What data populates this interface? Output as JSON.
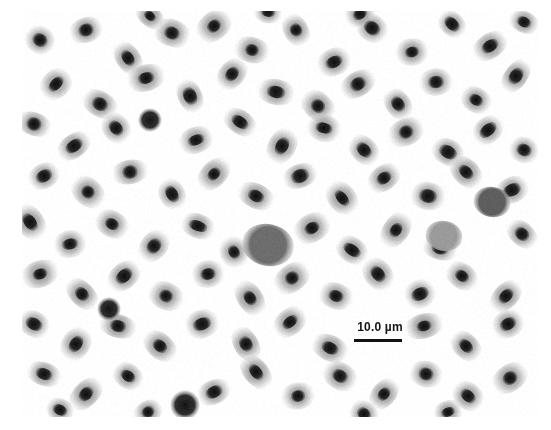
{
  "figure": {
    "kind": "light-microscopy-photomicrograph",
    "specimen": "blood smear",
    "background_color": "#ffffff",
    "frame": {
      "x": 22,
      "y": 11,
      "width": 516,
      "height": 406
    }
  },
  "scalebar": {
    "label": "10.0 µm",
    "bar_color": "#121212",
    "text_color": "#151515",
    "bar_length_px": 48,
    "position": {
      "x": 345,
      "y": 320
    }
  },
  "palette": {
    "background": "#ffffff",
    "cytoplasm_light": "#e7e7e7",
    "cytoplasm_mid": "#b9b9b9",
    "nucleus_dark": "#1d1d1d",
    "leukocyte_gray": "#6a6a6a",
    "platelet_dark": "#161616"
  },
  "chart_data": {
    "type": "scatter",
    "title": "",
    "xlabel": "",
    "ylabel": "",
    "xlim": [
      22,
      538
    ],
    "ylim": [
      11,
      417
    ],
    "grid": false,
    "legend": null,
    "series": [
      {
        "name": "erythrocyte",
        "marker": "ellipse-with-nucleus",
        "cell_rx": 19,
        "cell_ry": 13,
        "nucleus_rx": 9,
        "nucleus_ry": 6,
        "points": [
          {
            "x": 40,
            "y": 40,
            "rot": 35,
            "s": 1.0
          },
          {
            "x": 86,
            "y": 30,
            "rot": -20,
            "s": 1.0
          },
          {
            "x": 128,
            "y": 58,
            "rot": 55,
            "s": 0.95
          },
          {
            "x": 172,
            "y": 33,
            "rot": 20,
            "s": 1.0
          },
          {
            "x": 214,
            "y": 26,
            "rot": -40,
            "s": 1.0
          },
          {
            "x": 252,
            "y": 50,
            "rot": 15,
            "s": 1.0
          },
          {
            "x": 296,
            "y": 30,
            "rot": 60,
            "s": 0.95
          },
          {
            "x": 334,
            "y": 62,
            "rot": -25,
            "s": 1.0
          },
          {
            "x": 372,
            "y": 28,
            "rot": 35,
            "s": 1.0
          },
          {
            "x": 412,
            "y": 52,
            "rot": -10,
            "s": 1.0
          },
          {
            "x": 452,
            "y": 24,
            "rot": 45,
            "s": 0.95
          },
          {
            "x": 490,
            "y": 46,
            "rot": -35,
            "s": 1.0
          },
          {
            "x": 524,
            "y": 22,
            "rot": 25,
            "s": 0.9
          },
          {
            "x": 56,
            "y": 84,
            "rot": -45,
            "s": 1.0
          },
          {
            "x": 100,
            "y": 104,
            "rot": 30,
            "s": 1.0
          },
          {
            "x": 146,
            "y": 78,
            "rot": -15,
            "s": 1.0
          },
          {
            "x": 190,
            "y": 96,
            "rot": 65,
            "s": 1.0
          },
          {
            "x": 232,
            "y": 74,
            "rot": -50,
            "s": 1.0
          },
          {
            "x": 276,
            "y": 92,
            "rot": 10,
            "s": 1.0
          },
          {
            "x": 318,
            "y": 106,
            "rot": 40,
            "s": 1.0
          },
          {
            "x": 358,
            "y": 84,
            "rot": -30,
            "s": 1.0
          },
          {
            "x": 398,
            "y": 104,
            "rot": 55,
            "s": 1.0
          },
          {
            "x": 436,
            "y": 82,
            "rot": -5,
            "s": 1.0
          },
          {
            "x": 476,
            "y": 100,
            "rot": 30,
            "s": 1.0
          },
          {
            "x": 516,
            "y": 76,
            "rot": -55,
            "s": 0.95
          },
          {
            "x": 34,
            "y": 124,
            "rot": 20,
            "s": 1.0
          },
          {
            "x": 74,
            "y": 146,
            "rot": -35,
            "s": 1.0
          },
          {
            "x": 116,
            "y": 128,
            "rot": 50,
            "s": 1.0
          },
          {
            "x": 196,
            "y": 140,
            "rot": -20,
            "s": 1.0
          },
          {
            "x": 240,
            "y": 122,
            "rot": 35,
            "s": 1.0
          },
          {
            "x": 282,
            "y": 146,
            "rot": -60,
            "s": 1.0
          },
          {
            "x": 324,
            "y": 128,
            "rot": 15,
            "s": 1.0
          },
          {
            "x": 364,
            "y": 150,
            "rot": 45,
            "s": 1.0
          },
          {
            "x": 406,
            "y": 132,
            "rot": -25,
            "s": 1.0
          },
          {
            "x": 448,
            "y": 152,
            "rot": 30,
            "s": 1.0
          },
          {
            "x": 488,
            "y": 130,
            "rot": -40,
            "s": 1.0
          },
          {
            "x": 524,
            "y": 150,
            "rot": 20,
            "s": 0.95
          },
          {
            "x": 44,
            "y": 176,
            "rot": -30,
            "s": 1.0
          },
          {
            "x": 88,
            "y": 192,
            "rot": 40,
            "s": 1.0
          },
          {
            "x": 130,
            "y": 172,
            "rot": -10,
            "s": 1.0
          },
          {
            "x": 172,
            "y": 194,
            "rot": 60,
            "s": 1.0
          },
          {
            "x": 214,
            "y": 174,
            "rot": -45,
            "s": 1.0
          },
          {
            "x": 256,
            "y": 196,
            "rot": 25,
            "s": 1.0
          },
          {
            "x": 300,
            "y": 176,
            "rot": -20,
            "s": 1.0
          },
          {
            "x": 342,
            "y": 198,
            "rot": 50,
            "s": 1.0
          },
          {
            "x": 384,
            "y": 178,
            "rot": -35,
            "s": 1.0
          },
          {
            "x": 428,
            "y": 196,
            "rot": 10,
            "s": 1.0
          },
          {
            "x": 466,
            "y": 172,
            "rot": 45,
            "s": 1.0
          },
          {
            "x": 512,
            "y": 190,
            "rot": -25,
            "s": 1.0
          },
          {
            "x": 30,
            "y": 222,
            "rot": 55,
            "s": 1.0
          },
          {
            "x": 70,
            "y": 244,
            "rot": -15,
            "s": 1.0
          },
          {
            "x": 112,
            "y": 224,
            "rot": 30,
            "s": 1.0
          },
          {
            "x": 154,
            "y": 246,
            "rot": -50,
            "s": 1.0
          },
          {
            "x": 198,
            "y": 226,
            "rot": 20,
            "s": 1.0
          },
          {
            "x": 234,
            "y": 252,
            "rot": 65,
            "s": 1.0
          },
          {
            "x": 312,
            "y": 228,
            "rot": -30,
            "s": 1.0
          },
          {
            "x": 352,
            "y": 250,
            "rot": 35,
            "s": 1.0
          },
          {
            "x": 396,
            "y": 230,
            "rot": -55,
            "s": 1.0
          },
          {
            "x": 440,
            "y": 248,
            "rot": 15,
            "s": 1.0
          },
          {
            "x": 522,
            "y": 234,
            "rot": 40,
            "s": 0.95
          },
          {
            "x": 40,
            "y": 274,
            "rot": -20,
            "s": 1.0
          },
          {
            "x": 82,
            "y": 294,
            "rot": 45,
            "s": 1.0
          },
          {
            "x": 124,
            "y": 276,
            "rot": -40,
            "s": 1.0
          },
          {
            "x": 166,
            "y": 296,
            "rot": 25,
            "s": 1.0
          },
          {
            "x": 208,
            "y": 274,
            "rot": -10,
            "s": 1.0
          },
          {
            "x": 250,
            "y": 298,
            "rot": 55,
            "s": 1.0
          },
          {
            "x": 292,
            "y": 278,
            "rot": -35,
            "s": 1.0
          },
          {
            "x": 336,
            "y": 296,
            "rot": 20,
            "s": 1.0
          },
          {
            "x": 378,
            "y": 274,
            "rot": 50,
            "s": 1.0
          },
          {
            "x": 420,
            "y": 294,
            "rot": -25,
            "s": 1.0
          },
          {
            "x": 462,
            "y": 276,
            "rot": 35,
            "s": 1.0
          },
          {
            "x": 506,
            "y": 296,
            "rot": -45,
            "s": 1.0
          },
          {
            "x": 34,
            "y": 324,
            "rot": 30,
            "s": 1.0
          },
          {
            "x": 76,
            "y": 344,
            "rot": -55,
            "s": 1.0
          },
          {
            "x": 118,
            "y": 326,
            "rot": 15,
            "s": 1.0
          },
          {
            "x": 160,
            "y": 346,
            "rot": 40,
            "s": 1.0
          },
          {
            "x": 202,
            "y": 324,
            "rot": -20,
            "s": 1.0
          },
          {
            "x": 246,
            "y": 344,
            "rot": 60,
            "s": 1.0
          },
          {
            "x": 290,
            "y": 322,
            "rot": -40,
            "s": 1.0
          },
          {
            "x": 330,
            "y": 348,
            "rot": 25,
            "s": 1.0
          },
          {
            "x": 424,
            "y": 326,
            "rot": -15,
            "s": 1.0
          },
          {
            "x": 466,
            "y": 346,
            "rot": 45,
            "s": 1.0
          },
          {
            "x": 508,
            "y": 324,
            "rot": -30,
            "s": 1.0
          },
          {
            "x": 44,
            "y": 374,
            "rot": 20,
            "s": 1.0
          },
          {
            "x": 86,
            "y": 394,
            "rot": -45,
            "s": 1.0
          },
          {
            "x": 128,
            "y": 376,
            "rot": 35,
            "s": 1.0
          },
          {
            "x": 214,
            "y": 392,
            "rot": -25,
            "s": 1.0
          },
          {
            "x": 256,
            "y": 372,
            "rot": 50,
            "s": 1.0
          },
          {
            "x": 298,
            "y": 396,
            "rot": -10,
            "s": 1.0
          },
          {
            "x": 340,
            "y": 376,
            "rot": 30,
            "s": 1.0
          },
          {
            "x": 384,
            "y": 394,
            "rot": -50,
            "s": 1.0
          },
          {
            "x": 426,
            "y": 374,
            "rot": 15,
            "s": 1.0
          },
          {
            "x": 468,
            "y": 396,
            "rot": 40,
            "s": 1.0
          },
          {
            "x": 510,
            "y": 378,
            "rot": -35,
            "s": 1.0
          },
          {
            "x": 60,
            "y": 410,
            "rot": 25,
            "s": 0.9
          },
          {
            "x": 148,
            "y": 412,
            "rot": -30,
            "s": 0.9
          },
          {
            "x": 364,
            "y": 414,
            "rot": 45,
            "s": 0.9
          },
          {
            "x": 448,
            "y": 412,
            "rot": -20,
            "s": 0.9
          },
          {
            "x": 268,
            "y": 12,
            "rot": 10,
            "s": 0.85
          },
          {
            "x": 360,
            "y": 14,
            "rot": -30,
            "s": 0.85
          },
          {
            "x": 150,
            "y": 16,
            "rot": 40,
            "s": 0.85
          }
        ]
      },
      {
        "name": "leukocyte",
        "marker": "large-gray-blob",
        "points": [
          {
            "x": 268,
            "y": 245,
            "r": 21,
            "gray": "#6d6d6d"
          },
          {
            "x": 492,
            "y": 202,
            "r": 15,
            "gray": "#5e5e5e"
          },
          {
            "x": 444,
            "y": 236,
            "r": 15,
            "gray": "#9a9a9a"
          }
        ]
      },
      {
        "name": "platelet",
        "marker": "small-dark-dot",
        "points": [
          {
            "x": 150,
            "y": 120,
            "r": 8
          },
          {
            "x": 185,
            "y": 405,
            "r": 10
          },
          {
            "x": 109,
            "y": 309,
            "r": 8
          }
        ]
      }
    ]
  }
}
